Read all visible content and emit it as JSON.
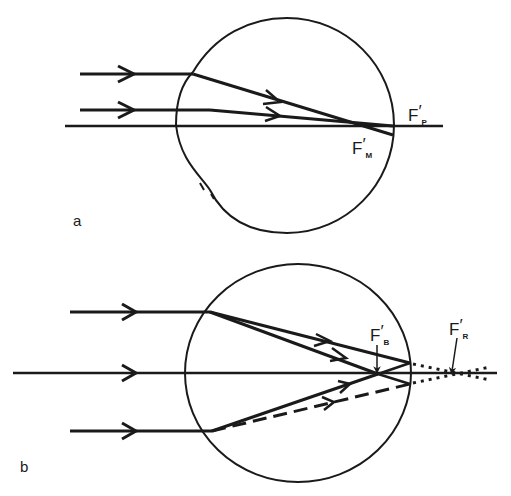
{
  "figure": {
    "panels": [
      {
        "id": "a",
        "label": "a",
        "description": "Parallel rays entering eye focus at different points on the optical axis",
        "focal_labels": {
          "paraxial": {
            "main": "F",
            "prime": "′",
            "sub": "P"
          },
          "marginal": {
            "main": "F",
            "prime": "′",
            "sub": "M"
          }
        }
      },
      {
        "id": "b",
        "label": "b",
        "description": "Rays through eye with blur and retinal focus points",
        "focal_labels": {
          "blur": {
            "main": "F",
            "prime": "′",
            "sub": "B"
          },
          "retinal": {
            "main": "F",
            "prime": "′",
            "sub": "R"
          }
        }
      }
    ],
    "colors": {
      "ink": "#1a1a1a",
      "background": "#ffffff"
    }
  }
}
